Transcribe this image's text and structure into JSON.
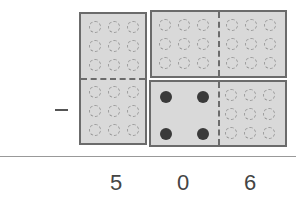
{
  "operation": {
    "symbol": "minus",
    "label": "subtraction"
  },
  "minuend_blocks": {
    "left_tall_block": {
      "description": "vertical block of two 3x3 groups of empty circles",
      "top_group": 9,
      "bottom_group": 9
    },
    "top_right_block": {
      "description": "horizontal block of two 3x3 groups of empty circles",
      "left_group": 9,
      "right_group": 9
    },
    "bottom_right_block": {
      "description": "left half with 4 filled dots, right half with 9 empty circles",
      "filled_dots": 4,
      "empty_circles": 9
    }
  },
  "answer": {
    "digits": [
      "5",
      "0",
      "6"
    ]
  },
  "colors": {
    "block_fill": "#d9d9d9",
    "block_border": "#6b6b6b",
    "filled_dot": "#3a3a3a",
    "empty_circle": "#9a9a9a"
  }
}
